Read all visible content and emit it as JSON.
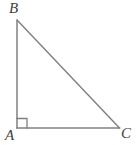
{
  "figure": {
    "name": "right-triangle-ABC",
    "background_color": "#ffffff",
    "stroke_color": "#808080",
    "label_color": "#3f3f3f",
    "stroke_width": 1.4,
    "labels": {
      "vertex_a": "A",
      "vertex_b": "B",
      "vertex_c": "C"
    },
    "right_angle_marker": {
      "at_vertex": "A",
      "size": 10,
      "shown": true
    },
    "geometry": {
      "points": {
        "A": {
          "x": 17,
          "y": 128
        },
        "B": {
          "x": 17,
          "y": 20
        },
        "C": {
          "x": 119,
          "y": 128
        }
      },
      "segments": [
        {
          "name": "AB",
          "from": "A",
          "to": "B"
        },
        {
          "name": "BC",
          "from": "B",
          "to": "C"
        },
        {
          "name": "AC",
          "from": "A",
          "to": "C"
        }
      ]
    }
  }
}
